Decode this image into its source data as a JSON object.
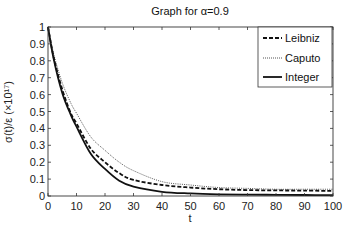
{
  "chart_data": {
    "type": "line",
    "title": "Graph for α=0.9",
    "xlabel": "t",
    "ylabel": "σ(t)/ε (×10¹⁷)",
    "xlim": [
      0,
      100
    ],
    "ylim": [
      0,
      1
    ],
    "xticks": [
      0,
      10,
      20,
      30,
      40,
      50,
      60,
      70,
      80,
      90,
      100
    ],
    "yticks": [
      0,
      0.1,
      0.2,
      0.3,
      0.4,
      0.5,
      0.6,
      0.7,
      0.8,
      0.9,
      1
    ],
    "ytick_labels": [
      "0",
      "0.1",
      "0.2",
      "0.3",
      "0.4",
      "0.5",
      "0.6",
      "0.7",
      "0.8",
      "0.9",
      "1"
    ],
    "grid": false,
    "legend_position": "upper right",
    "x": [
      0,
      2,
      5,
      8,
      10,
      15,
      20,
      25,
      30,
      40,
      50,
      60,
      70,
      80,
      90,
      100
    ],
    "series": [
      {
        "name": "Leibniz",
        "style": "dashed",
        "values": [
          1.0,
          0.82,
          0.63,
          0.49,
          0.43,
          0.28,
          0.2,
          0.135,
          0.095,
          0.065,
          0.05,
          0.04,
          0.035,
          0.033,
          0.032,
          0.03
        ]
      },
      {
        "name": "Caputo",
        "style": "dotted",
        "values": [
          1.0,
          0.84,
          0.67,
          0.55,
          0.49,
          0.35,
          0.27,
          0.2,
          0.15,
          0.085,
          0.065,
          0.05,
          0.045,
          0.04,
          0.04,
          0.04
        ]
      },
      {
        "name": "Integer",
        "style": "solid",
        "values": [
          1.0,
          0.81,
          0.61,
          0.48,
          0.41,
          0.25,
          0.16,
          0.09,
          0.055,
          0.025,
          0.015,
          0.01,
          0.008,
          0.007,
          0.006,
          0.005
        ]
      }
    ]
  },
  "legend": {
    "items": [
      {
        "label": "Leibniz"
      },
      {
        "label": "Caputo"
      },
      {
        "label": "Integer"
      }
    ]
  },
  "colors": {
    "lines": "#111111",
    "axis": "#333333"
  }
}
